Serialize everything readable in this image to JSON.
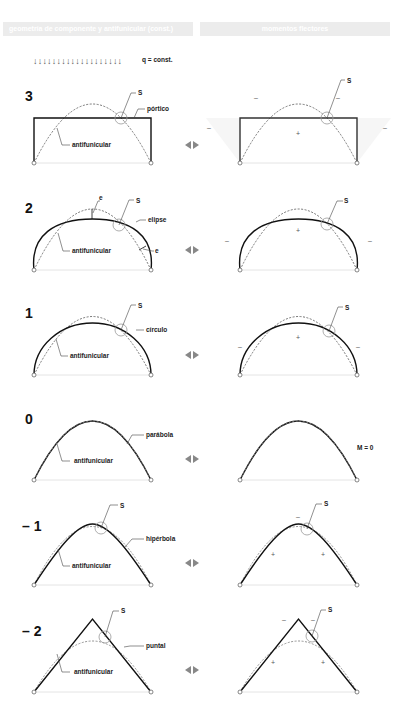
{
  "headers": {
    "left": "geometría de componente y antifunicular (const.)",
    "right": "momentos flectores"
  },
  "load": {
    "arrows": "↓↓↓↓↓↓↓↓↓↓↓↓↓↓↓↓↓↓↓",
    "label": "q = const."
  },
  "sections": [
    {
      "index": "3",
      "shape_label": "pórtico",
      "antifunicular_label": "antifunicular",
      "s_label": "S",
      "right_note": ""
    },
    {
      "index": "2",
      "shape_label": "elipse",
      "antifunicular_label": "antifunicular",
      "s_label": "S",
      "e_label": "e",
      "right_note": ""
    },
    {
      "index": "1",
      "shape_label": "círculo",
      "antifunicular_label": "antifunicular",
      "s_label": "S",
      "right_note": ""
    },
    {
      "index": "0",
      "shape_label": "parábola",
      "antifunicular_label": "antifunicular",
      "s_label": "",
      "right_note": "M = 0"
    },
    {
      "index": "– 1",
      "shape_label": "hipérbola",
      "antifunicular_label": "antifunicular",
      "s_label": "S",
      "right_note": ""
    },
    {
      "index": "– 2",
      "shape_label": "puntal",
      "antifunicular_label": "antifunicular",
      "s_label": "S",
      "right_note": ""
    }
  ],
  "signs": {
    "plus": "+",
    "minus": "–"
  },
  "icons": {
    "compare": "double-arrow-left-right-icon"
  }
}
